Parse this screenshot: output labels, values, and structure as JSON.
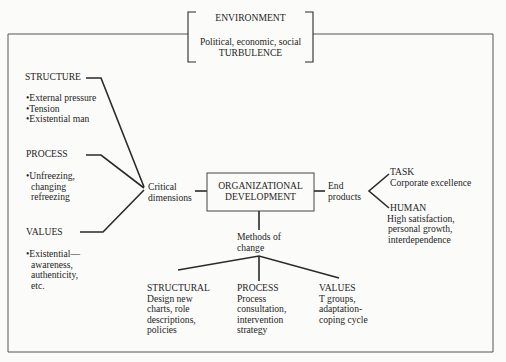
{
  "environment": {
    "title": "ENVIRONMENT",
    "line1": "Political, economic, social",
    "line2": "TURBULENCE"
  },
  "critical_dimensions": {
    "label_line1": "Critical",
    "label_line2": "dimensions",
    "structure": {
      "title": "STRUCTURE",
      "items": [
        "•External pressure",
        "•Tension",
        "•Existential man"
      ]
    },
    "process": {
      "title": "PROCESS",
      "items": [
        "•Unfreezing,",
        "changing",
        "refreezing"
      ]
    },
    "values": {
      "title": "VALUES",
      "items": [
        "•Existential—",
        "awareness,",
        "authenticity,",
        "etc."
      ]
    }
  },
  "center": {
    "line1": "ORGANIZATIONAL",
    "line2": "DEVELOPMENT"
  },
  "end_products": {
    "label_line1": "End",
    "label_line2": "products",
    "task": {
      "title": "TASK",
      "lines": [
        "Corporate excellence"
      ]
    },
    "human": {
      "title": "HUMAN",
      "lines": [
        "High satisfaction,",
        "personal growth,",
        "interdependence"
      ]
    }
  },
  "methods_of_change": {
    "label_line1": "Methods of",
    "label_line2": "change",
    "structural": {
      "title": "STRUCTURAL",
      "lines": [
        "Design new",
        "charts, role",
        "descriptions,",
        "policies"
      ]
    },
    "process": {
      "title": "PROCESS",
      "lines": [
        "Process",
        "consultation,",
        "intervention",
        "strategy"
      ]
    },
    "values": {
      "title": "VALUES",
      "lines": [
        "T groups,",
        "adaptation-",
        "coping cycle"
      ]
    }
  }
}
